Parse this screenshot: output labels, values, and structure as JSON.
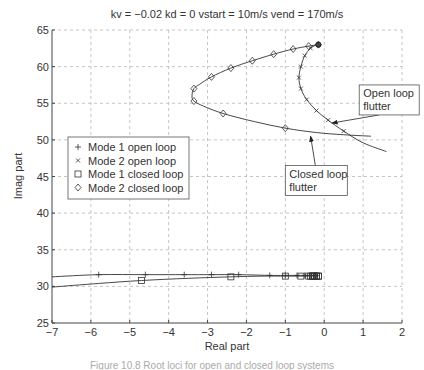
{
  "chart_data": {
    "type": "line",
    "title": "kv = −0.02  kd = 0  vstart = 10m/s  vend = 170m/s",
    "xlabel": "Real part",
    "ylabel": "Imag part",
    "xlim": [
      -7,
      2
    ],
    "ylim": [
      25,
      65
    ],
    "xticks": [
      -7,
      -6,
      -5,
      -4,
      -3,
      -2,
      -1,
      0,
      1,
      2
    ],
    "xtick_labels": [
      "−7",
      "−6",
      "−5",
      "−4",
      "−3",
      "−2",
      "−1",
      "0",
      "1",
      "2"
    ],
    "yticks": [
      25,
      30,
      35,
      40,
      45,
      50,
      55,
      60,
      65
    ],
    "ytick_labels": [
      "25",
      "30",
      "35",
      "40",
      "45",
      "50",
      "55",
      "60",
      "65"
    ],
    "grid": true,
    "legend_position": "upper left (inside, x≈-6.8, y≈50)",
    "legend": [
      {
        "label": "Mode 1 open loop",
        "marker": "+"
      },
      {
        "label": "Mode 2 open loop",
        "marker": "x"
      },
      {
        "label": "Mode 1 closed loop",
        "marker": "square"
      },
      {
        "label": "Mode 2 closed loop",
        "marker": "diamond"
      }
    ],
    "series": [
      {
        "name": "Mode 1 open loop",
        "marker": "+",
        "x": [
          -7.0,
          -5.8,
          -4.6,
          -3.6,
          -2.9,
          -2.2,
          -1.4,
          -1.0,
          -0.7,
          -0.5,
          -0.35,
          -0.25,
          -0.2
        ],
        "y": [
          31.3,
          31.6,
          31.6,
          31.6,
          31.6,
          31.6,
          31.5,
          31.5,
          31.5,
          31.5,
          31.5,
          31.5,
          31.5
        ],
        "marker_idx": [
          1,
          2,
          3,
          4,
          5,
          6,
          7,
          8,
          9,
          10,
          11,
          12
        ]
      },
      {
        "name": "Mode 2 open loop",
        "marker": "x",
        "x": [
          -0.2,
          -0.35,
          -0.5,
          -0.6,
          -0.65,
          -0.6,
          -0.45,
          -0.2,
          0.1,
          0.5,
          1.0,
          1.6
        ],
        "y": [
          63.0,
          62.5,
          61.5,
          60.0,
          58.5,
          57.0,
          55.5,
          54.0,
          52.7,
          51.2,
          49.6,
          48.4
        ],
        "marker_idx": [
          1,
          2,
          3,
          4,
          5,
          6,
          7,
          8,
          9
        ]
      },
      {
        "name": "Mode 1 closed loop",
        "marker": "square",
        "x": [
          -7.0,
          -5.8,
          -4.7,
          -3.5,
          -2.4,
          -1.6,
          -1.0,
          -0.6,
          -0.4,
          -0.3,
          -0.25,
          -0.2,
          -0.15
        ],
        "y": [
          29.9,
          30.4,
          30.8,
          31.1,
          31.3,
          31.4,
          31.4,
          31.4,
          31.4,
          31.4,
          31.4,
          31.4,
          31.4
        ],
        "marker_idx": [
          2,
          4,
          6,
          7,
          8,
          9,
          10,
          11,
          12
        ]
      },
      {
        "name": "Mode 2 closed loop",
        "marker": "diamond",
        "x": [
          -0.15,
          -0.4,
          -0.8,
          -1.3,
          -1.85,
          -2.4,
          -2.9,
          -3.2,
          -3.35,
          -3.4,
          -3.35,
          -3.1,
          -2.6,
          -1.8,
          -1.0,
          -0.2,
          0.5,
          1.2
        ],
        "y": [
          63.0,
          62.8,
          62.4,
          61.7,
          60.8,
          59.8,
          58.6,
          57.6,
          57.0,
          56.0,
          55.3,
          54.6,
          53.6,
          52.5,
          51.6,
          51.0,
          50.7,
          50.5
        ],
        "marker_idx": [
          0,
          1,
          2,
          3,
          4,
          5,
          6,
          8,
          10,
          12,
          14
        ]
      }
    ],
    "annotations": [
      {
        "text": [
          "Open loop",
          "flutter"
        ],
        "box_at": [
          0.9,
          57.5
        ],
        "arrow_to": [
          0.2,
          52.3
        ]
      },
      {
        "text": [
          "Closed loop",
          "flutter"
        ],
        "box_at": [
          -1.0,
          46.5
        ],
        "arrow_to": [
          -0.35,
          50.5
        ]
      }
    ]
  },
  "caption": "Figure 10.8  Root loci for open and closed loop systems"
}
